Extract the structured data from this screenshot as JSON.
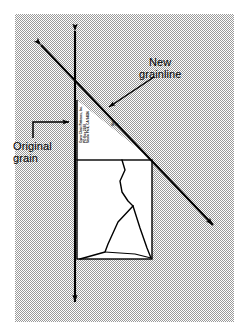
{
  "figure": {
    "background_color": "#ffffff",
    "panel_color": "#c8c8c8"
  },
  "labels": {
    "new_grainline": {
      "line1": "New",
      "line2": "grainline"
    },
    "original_grain": {
      "line1": "Original",
      "line2": "grain"
    }
  },
  "pattern_piece": {
    "company_block": {
      "line1": "Open Chair Patterns, Inc.",
      "line2": "PO Box 2288",
      "line3": "Menlo Park, CA 94026"
    },
    "size_block": {
      "line1": "Size",
      "line2": "12"
    }
  },
  "arrows": {
    "original_grain_axis": {
      "name": "vertical-double-arrow",
      "x": 75,
      "y_top": 28,
      "y_bottom": 305,
      "double_headed": true
    },
    "new_grainline_axis": {
      "name": "diagonal-double-arrow",
      "x1": 38,
      "y1": 42,
      "x2": 216,
      "y2": 228,
      "double_headed": true
    },
    "new_grainline_pointer": {
      "x1": 152,
      "y1": 78,
      "x2": 107,
      "y2": 108
    },
    "original_grain_pointer": {
      "x1": 28,
      "y1": 122,
      "x2": 74,
      "y2": 122
    }
  },
  "colors": {
    "ink": "#000000",
    "panel": "#c8c8c8",
    "paper": "#ffffff"
  }
}
